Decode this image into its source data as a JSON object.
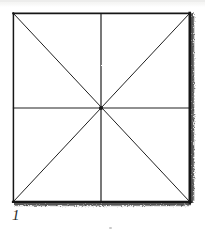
{
  "figure": {
    "label": "1",
    "caption_number": "1",
    "medium": "scanned hand-drawn line diagram",
    "background_color": "#ffffff",
    "ink_color": "#1c1c1c",
    "shadow_edge_color": "#2b2b2b",
    "faint_scan_band_color": "#f0f0ef",
    "geometry": {
      "shape": "square",
      "sectors": 8,
      "square": {
        "left": 13,
        "top": 13,
        "right": 190,
        "bottom": 202,
        "width": 177,
        "height": 189
      },
      "center": {
        "x": 101,
        "y": 108
      },
      "corners": [
        {
          "name": "top-left",
          "x": 13,
          "y": 13
        },
        {
          "name": "top-right",
          "x": 190,
          "y": 13
        },
        {
          "name": "bottom-right",
          "x": 190,
          "y": 202
        },
        {
          "name": "bottom-left",
          "x": 13,
          "y": 202
        }
      ],
      "lines": [
        {
          "name": "top-edge",
          "x1": 13,
          "y1": 13,
          "x2": 190,
          "y2": 13,
          "weight": 1.6
        },
        {
          "name": "left-edge",
          "x1": 13,
          "y1": 13,
          "x2": 13,
          "y2": 202,
          "weight": 1.5
        },
        {
          "name": "right-edge",
          "x1": 190,
          "y1": 13,
          "x2": 190,
          "y2": 202,
          "weight": 2.6
        },
        {
          "name": "bottom-edge",
          "x1": 13,
          "y1": 202,
          "x2": 190,
          "y2": 202,
          "weight": 2.2
        },
        {
          "name": "vertical-median",
          "x1": 101,
          "y1": 13,
          "x2": 101,
          "y2": 202,
          "weight": 1.1
        },
        {
          "name": "horizontal-median",
          "x1": 13,
          "y1": 108,
          "x2": 190,
          "y2": 108,
          "weight": 1.1
        },
        {
          "name": "diagonal-tl-br",
          "x1": 13,
          "y1": 13,
          "x2": 190,
          "y2": 202,
          "weight": 1.0
        },
        {
          "name": "diagonal-tr-bl",
          "x1": 190,
          "y1": 13,
          "x2": 13,
          "y2": 202,
          "weight": 1.0
        }
      ],
      "ragged_edges": [
        "right-edge",
        "bottom-edge"
      ]
    }
  }
}
